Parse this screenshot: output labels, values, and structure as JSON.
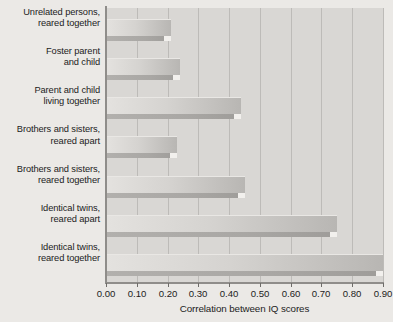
{
  "chart_data": {
    "type": "bar",
    "orientation": "horizontal",
    "title": "",
    "xlabel": "Correlation between IQ scores",
    "ylabel": "",
    "xlim": [
      0.0,
      0.9
    ],
    "grid": true,
    "legend": false,
    "categories": [
      "Unrelated persons, reared together",
      "Foster parent and child",
      "Parent and child living together",
      "Brothers and sisters, reared apart",
      "Brothers and sisters, reared together",
      "Identical twins, reared apart",
      "Identical twins, reared together"
    ],
    "category_lines": [
      [
        "Unrelated persons,",
        "reared together"
      ],
      [
        "Foster parent",
        "and child"
      ],
      [
        "Parent and child",
        "living together"
      ],
      [
        "Brothers and sisters,",
        "reared apart"
      ],
      [
        "Brothers and sisters,",
        "reared together"
      ],
      [
        "Identical twins,",
        "reared apart"
      ],
      [
        "Identical twins,",
        "reared together"
      ]
    ],
    "values": [
      0.21,
      0.24,
      0.44,
      0.23,
      0.45,
      0.75,
      0.9
    ],
    "xticks": [
      0.0,
      0.1,
      0.2,
      0.3,
      0.4,
      0.5,
      0.6,
      0.7,
      0.8,
      0.9
    ],
    "xtick_labels": [
      "0.00",
      "0.10",
      "0.20",
      "0.30",
      "0.40",
      "0.50",
      "0.60",
      "0.70",
      "0.80",
      "0.90"
    ],
    "colors": {
      "plot_background": "#d9d7d4",
      "page_background": "#ebe9e6",
      "gridline": "#bdbbb8",
      "bar_light": "#e4e2df",
      "bar_dark": "#b8b6b3",
      "bar_shadow": "#a9a7a4",
      "axis": "#8f8d8a",
      "text": "#1c1c1c"
    }
  }
}
